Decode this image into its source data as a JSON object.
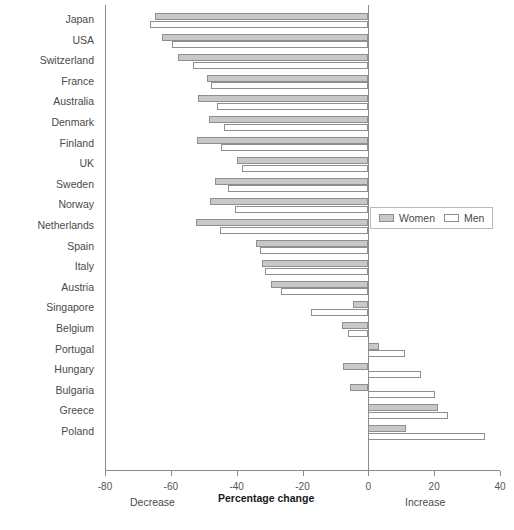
{
  "chart_data": {
    "type": "bar",
    "orientation": "horizontal",
    "title": "",
    "xlabel": "Percentage change",
    "ylabel": "",
    "xlim": [
      -80,
      40
    ],
    "xticks": [
      -80,
      -60,
      -40,
      -20,
      0,
      20,
      40
    ],
    "xtick_labels": [
      "-80",
      "-60",
      "-40",
      "-20",
      "0",
      "20",
      "40"
    ],
    "grid": false,
    "legend_position": "center-right",
    "annotations": {
      "left_caption": "Decrease",
      "center_caption": "Percentage change",
      "right_caption": "Increase"
    },
    "categories": [
      "Japan",
      "USA",
      "Switzerland",
      "France",
      "Australia",
      "Denmark",
      "Finland",
      "UK",
      "Sweden",
      "Norway",
      "Netherlands",
      "Spain",
      "Italy",
      "Austria",
      "Singapore",
      "Belgium",
      "Portugal",
      "Hungary",
      "Bulgaria",
      "Greece",
      "Poland"
    ],
    "series": [
      {
        "name": "Women",
        "color": "#c8c8c8",
        "values": [
          -64.7,
          -62.6,
          -57.8,
          -49.1,
          -51.7,
          -48.3,
          -52.0,
          -40.0,
          -46.6,
          -48.0,
          -52.3,
          -34.1,
          -32.3,
          -29.5,
          -4.6,
          -8.1,
          3.1,
          -7.8,
          -5.7,
          21.1,
          11.5
        ]
      },
      {
        "name": "Men",
        "color": "#ffffff",
        "values": [
          -66.4,
          -59.5,
          -53.2,
          -47.7,
          -46.0,
          -44.0,
          -44.8,
          -38.5,
          -42.5,
          -40.5,
          -45.0,
          -32.8,
          -31.4,
          -26.6,
          -17.3,
          -6.2,
          11.0,
          16.0,
          20.3,
          24.1,
          35.4
        ]
      }
    ]
  },
  "legend": {
    "items": [
      {
        "label": "Women",
        "swatch": "women-swatch"
      },
      {
        "label": "Men",
        "swatch": "men-swatch"
      }
    ]
  }
}
